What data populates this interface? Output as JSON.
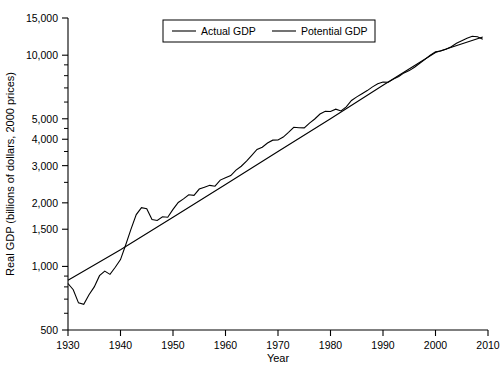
{
  "chart_data": {
    "type": "line",
    "title": "",
    "xlabel": "Year",
    "ylabel": "Real GDP (billions of dollars, 2000 prices)",
    "xlim": [
      1930,
      2010
    ],
    "ylim": [
      500,
      15000
    ],
    "yscale": "log",
    "grid": false,
    "legend_position": "top-center",
    "xticks": [
      1930,
      1940,
      1950,
      1960,
      1970,
      1980,
      1990,
      2000,
      2010
    ],
    "xtick_labels": [
      "1930",
      "1940",
      "1950",
      "1960",
      "1970",
      "1980",
      "1990",
      "2000",
      "2010"
    ],
    "yticks": [
      500,
      1000,
      1500,
      2000,
      3000,
      4000,
      5000,
      10000,
      15000
    ],
    "ytick_labels": [
      "500",
      "1,000",
      "1,500",
      "2,000",
      "3,000",
      "4,000",
      "5,000",
      "10,000",
      "15,000"
    ],
    "yticks_minor": [
      600,
      700,
      800,
      900,
      2500,
      3500,
      4500,
      6000,
      7000,
      8000,
      9000
    ],
    "colors": {
      "actual": "#000000",
      "potential": "#000000",
      "axis": "#000000"
    },
    "series": [
      {
        "name": "Actual GDP",
        "x": [
          1930,
          1931,
          1932,
          1933,
          1934,
          1935,
          1936,
          1937,
          1938,
          1939,
          1940,
          1941,
          1942,
          1943,
          1944,
          1945,
          1946,
          1947,
          1948,
          1949,
          1950,
          1951,
          1952,
          1953,
          1954,
          1955,
          1956,
          1957,
          1958,
          1959,
          1960,
          1961,
          1962,
          1963,
          1964,
          1965,
          1966,
          1967,
          1968,
          1969,
          1970,
          1971,
          1972,
          1973,
          1974,
          1975,
          1976,
          1977,
          1978,
          1979,
          1980,
          1981,
          1982,
          1983,
          1984,
          1985,
          1986,
          1987,
          1988,
          1989,
          1990,
          1991,
          1992,
          1993,
          1994,
          1995,
          1996,
          1997,
          1998,
          1999,
          2000,
          2001,
          2002,
          2003,
          2004,
          2005,
          2006,
          2007,
          2008,
          2009
        ],
        "y": [
          830,
          776,
          672,
          662,
          734,
          800,
          904,
          950,
          917,
          991,
          1077,
          1267,
          1502,
          1760,
          1899,
          1877,
          1667,
          1650,
          1718,
          1710,
          1861,
          2009,
          2088,
          2184,
          2170,
          2324,
          2372,
          2420,
          2398,
          2563,
          2627,
          2693,
          2857,
          2981,
          3154,
          3358,
          3577,
          3667,
          3840,
          3960,
          3968,
          4096,
          4312,
          4558,
          4534,
          4526,
          4768,
          4987,
          5264,
          5431,
          5414,
          5552,
          5443,
          5690,
          6102,
          6350,
          6575,
          6798,
          7079,
          7331,
          7465,
          7446,
          7705,
          7922,
          8246,
          8453,
          8771,
          9164,
          9559,
          9998,
          10380,
          10474,
          10659,
          10960,
          11390,
          11715,
          12030,
          12287,
          12228,
          11909
        ]
      },
      {
        "name": "Potential GDP",
        "x": [
          1930,
          1940,
          1950,
          1960,
          1970,
          1980,
          1990,
          2000,
          2009
        ],
        "y": [
          860,
          1200,
          1710,
          2440,
          3500,
          5000,
          7200,
          10300,
          12200
        ]
      }
    ],
    "legend": [
      "Actual GDP",
      "Potential GDP"
    ]
  }
}
